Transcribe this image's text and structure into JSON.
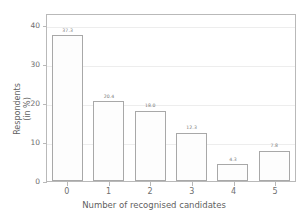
{
  "chart_data": {
    "type": "bar",
    "title": "",
    "xlabel": "Number of recognised candidates",
    "ylabel": "Respondents\n(in %)",
    "ylabel_line1": "Respondents",
    "ylabel_line2": "(in %)",
    "categories": [
      "0",
      "1",
      "2",
      "3",
      "4",
      "5"
    ],
    "values": [
      37.3,
      20.4,
      18.0,
      12.3,
      4.3,
      7.8
    ],
    "value_labels": [
      "37.3",
      "20.4",
      "18.0",
      "12.3",
      "4.3",
      "7.8"
    ],
    "ylim": [
      0,
      43
    ],
    "yticks": [
      0,
      10,
      20,
      30,
      40
    ],
    "ytick_labels": [
      "0",
      "10",
      "20",
      "30",
      "40"
    ],
    "xtick_labels": [
      "0",
      "1",
      "2",
      "3",
      "4",
      "5"
    ],
    "grid": true,
    "grid_axis": "y",
    "legend": null,
    "colors": {
      "bar_face": "#fdfdfd",
      "bar_edge": "#a8a8a8",
      "grid": "#ededed",
      "axis": "#b9b9b9",
      "text": "#6e6e6e",
      "background": "#ffffff"
    }
  }
}
